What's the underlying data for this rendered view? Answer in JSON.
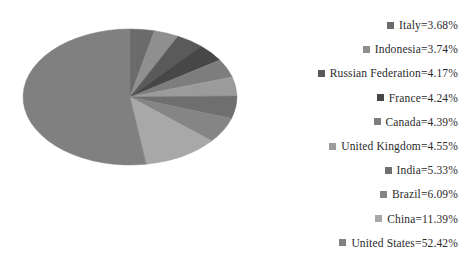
{
  "chart_data": {
    "type": "pie",
    "title": "",
    "legend_position": "right",
    "start_angle_deg": 0,
    "direction": "clockwise",
    "categories": [
      "Italy",
      "Indonesia",
      "Russian Federation",
      "France",
      "Canada",
      "United Kingdom",
      "India",
      "Brazil",
      "China",
      "United States"
    ],
    "values": [
      3.68,
      3.74,
      4.17,
      4.24,
      4.39,
      4.55,
      5.33,
      6.09,
      11.39,
      52.42
    ],
    "units": "%",
    "labels": [
      "Italy=3.68%",
      "Indonesia=3.74%",
      "Russian Federation=4.17%",
      "France=4.24%",
      "Canada=4.39%",
      "United Kingdom=4.55%",
      "India=5.33%",
      "Brazil=6.09%",
      "China=11.39%",
      "United States=52.42%"
    ],
    "colors": [
      "#6b6b6b",
      "#8f8f8f",
      "#5a5a5a",
      "#474747",
      "#7d7d7d",
      "#9b9b9b",
      "#6f6f6f",
      "#858585",
      "#a8a8a8",
      "#808080"
    ]
  },
  "legend": {
    "items": [
      {
        "label": "Italy=3.68%",
        "color": "#6b6b6b"
      },
      {
        "label": "Indonesia=3.74%",
        "color": "#8f8f8f"
      },
      {
        "label": "Russian Federation=4.17%",
        "color": "#5a5a5a"
      },
      {
        "label": "France=4.24%",
        "color": "#474747"
      },
      {
        "label": "Canada=4.39%",
        "color": "#7d7d7d"
      },
      {
        "label": "United Kingdom=4.55%",
        "color": "#9b9b9b"
      },
      {
        "label": "India=5.33%",
        "color": "#6f6f6f"
      },
      {
        "label": "Brazil=6.09%",
        "color": "#858585"
      },
      {
        "label": "China=11.39%",
        "color": "#a8a8a8"
      },
      {
        "label": "United States=52.42%",
        "color": "#808080"
      }
    ]
  }
}
